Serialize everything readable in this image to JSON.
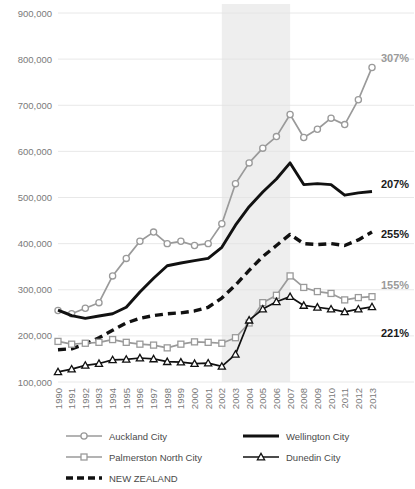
{
  "chart_data": {
    "type": "line",
    "title": "",
    "xlabel": "",
    "ylabel": "",
    "ylim": [
      100000,
      900000
    ],
    "ytick_labels": [
      "900,000",
      "800,000",
      "700,000",
      "600,000",
      "500,000",
      "400,000",
      "300,000",
      "200,000",
      "100,000"
    ],
    "ytick_values": [
      900000,
      800000,
      700000,
      600000,
      500000,
      400000,
      300000,
      200000,
      100000
    ],
    "grid": true,
    "legend_position": "bottom",
    "categories": [
      "1990",
      "1991",
      "1992",
      "1993",
      "1994",
      "1995",
      "1996",
      "1997",
      "1998",
      "1999",
      "2000",
      "2001",
      "2002",
      "2003",
      "2004",
      "2005",
      "2006",
      "2007",
      "2008",
      "2009",
      "2010",
      "2011",
      "2012",
      "2013"
    ],
    "highlight_band": {
      "from": "2002",
      "to": "2007",
      "color": "#ebebeb"
    },
    "series": [
      {
        "name": "Auckland City",
        "color": "#9a9a9a",
        "marker": "circle",
        "dash": "solid",
        "end_label": "307%",
        "end_label_color": "#9a9a9a",
        "values": [
          255000,
          248000,
          260000,
          272000,
          330000,
          368000,
          405000,
          425000,
          400000,
          405000,
          396000,
          400000,
          443000,
          530000,
          575000,
          607000,
          632000,
          680000,
          630000,
          648000,
          672000,
          658000,
          712000,
          782000
        ]
      },
      {
        "name": "Wellington City",
        "color": "#111111",
        "marker": "none",
        "dash": "solid",
        "end_label": "207%",
        "end_label_color": "#111111",
        "values": [
          256000,
          244000,
          238000,
          243000,
          248000,
          262000,
          295000,
          325000,
          352000,
          358000,
          363000,
          368000,
          392000,
          440000,
          480000,
          512000,
          540000,
          575000,
          528000,
          530000,
          528000,
          505000,
          510000,
          513000
        ]
      },
      {
        "name": "NEW ZEALAND",
        "color": "#111111",
        "marker": "none",
        "dash": "dashed",
        "end_label": "255%",
        "end_label_color": "#111111",
        "values": [
          170000,
          172000,
          182000,
          196000,
          212000,
          228000,
          238000,
          244000,
          248000,
          250000,
          254000,
          262000,
          282000,
          310000,
          342000,
          372000,
          396000,
          420000,
          400000,
          398000,
          400000,
          396000,
          408000,
          425000
        ]
      },
      {
        "name": "Palmerston North City",
        "color": "#9a9a9a",
        "marker": "square",
        "dash": "solid",
        "end_label": "155%",
        "end_label_color": "#9a9a9a",
        "values": [
          188000,
          182000,
          184000,
          186000,
          192000,
          186000,
          182000,
          180000,
          174000,
          182000,
          187000,
          186000,
          184000,
          196000,
          228000,
          272000,
          288000,
          330000,
          305000,
          296000,
          292000,
          278000,
          283000,
          285000
        ]
      },
      {
        "name": "Dunedin City",
        "color": "#111111",
        "marker": "triangle",
        "dash": "solid",
        "end_label": "221%",
        "end_label_color": "#111111",
        "values": [
          122000,
          128000,
          136000,
          140000,
          148000,
          149000,
          152000,
          150000,
          144000,
          143000,
          140000,
          141000,
          134000,
          160000,
          234000,
          258000,
          274000,
          285000,
          266000,
          262000,
          258000,
          252000,
          258000,
          263000
        ]
      }
    ],
    "legend": [
      {
        "label": "Auckland City",
        "color": "#9a9a9a",
        "marker": "circle",
        "dash": "solid"
      },
      {
        "label": "Wellington City",
        "color": "#111111",
        "marker": "none",
        "dash": "solid"
      },
      {
        "label": "Palmerston North City",
        "color": "#9a9a9a",
        "marker": "square",
        "dash": "solid"
      },
      {
        "label": "Dunedin City",
        "color": "#111111",
        "marker": "triangle",
        "dash": "solid"
      },
      {
        "label": "NEW ZEALAND",
        "color": "#111111",
        "marker": "none",
        "dash": "dashed"
      }
    ]
  }
}
